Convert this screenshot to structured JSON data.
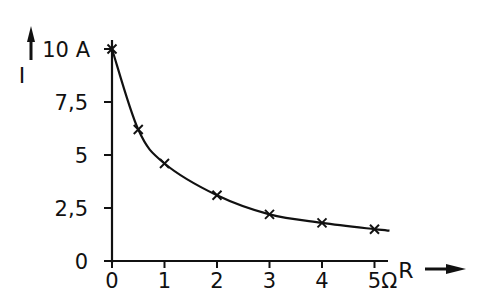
{
  "chart_data": {
    "type": "line",
    "title": "",
    "xlabel": "R",
    "ylabel": "I",
    "x_unit": "Ω",
    "y_unit": "A",
    "x_tick_labels": [
      "0",
      "1",
      "2",
      "3",
      "4",
      "5Ω"
    ],
    "y_tick_labels": [
      "0",
      "2,5",
      "5",
      "7,5",
      "10 A"
    ],
    "x_ticks": [
      0,
      1,
      2,
      3,
      4,
      5
    ],
    "y_ticks": [
      0,
      2.5,
      5,
      7.5,
      10
    ],
    "xlim": [
      0,
      5.2
    ],
    "ylim": [
      0,
      10
    ],
    "grid": false,
    "legend": null,
    "series": [
      {
        "name": "I(R)",
        "marker": "x",
        "points": [
          {
            "x": 0,
            "y": 10
          },
          {
            "x": 0.5,
            "y": 6.2
          },
          {
            "x": 1,
            "y": 4.6
          },
          {
            "x": 2,
            "y": 3.1
          },
          {
            "x": 3,
            "y": 2.2
          },
          {
            "x": 4,
            "y": 1.8
          },
          {
            "x": 5,
            "y": 1.5
          }
        ]
      }
    ]
  },
  "labels": {
    "y_axis_title": "I",
    "x_axis_title": "R"
  },
  "colors": {
    "ink": "#111111",
    "background": "#ffffff"
  }
}
